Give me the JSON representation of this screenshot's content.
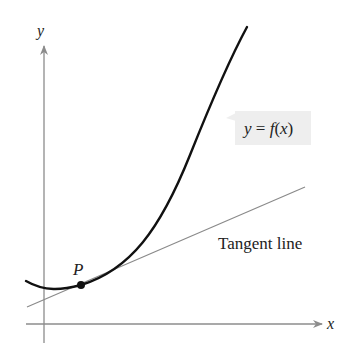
{
  "diagram": {
    "axes": {
      "x_label": "x",
      "y_label": "y"
    },
    "curve": {
      "label": "y = f(x)",
      "color": "#111111"
    },
    "tangent": {
      "label": "Tangent line",
      "color": "#8a8a8a"
    },
    "point": {
      "label": "P"
    },
    "colors": {
      "axis": "#8c8c8c",
      "label_box": "#eeeeee",
      "text": "#222222"
    }
  }
}
